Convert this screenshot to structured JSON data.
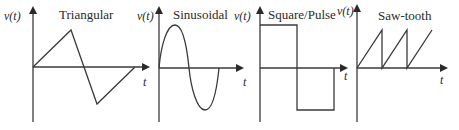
{
  "diagram": {
    "type": "waveform-comparison",
    "panels": [
      {
        "title": "Triangular",
        "y_axis_label": "v(t)",
        "x_axis_label": "t"
      },
      {
        "title": "Sinusoidal",
        "y_axis_label": "v(t)",
        "x_axis_label": "t"
      },
      {
        "title": "Square/Pulse",
        "y_axis_label": "v(t)",
        "x_axis_label": "t"
      },
      {
        "title": "Saw-tooth",
        "y_axis_label": "v(t)",
        "x_axis_label": "t"
      }
    ],
    "colors": {
      "line": "#3a3a3a",
      "background": "#ffffff"
    }
  }
}
